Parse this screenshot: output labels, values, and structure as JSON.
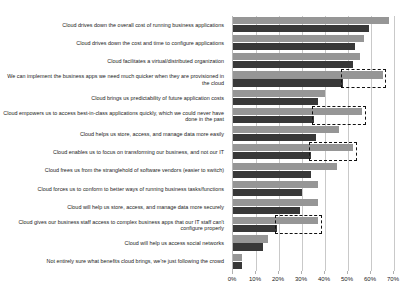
{
  "chart_data": {
    "type": "bar",
    "orientation": "horizontal",
    "title": "",
    "xlabel": "",
    "ylabel": "",
    "xlim": [
      0,
      70
    ],
    "xticks": [
      0,
      10,
      20,
      30,
      40,
      50,
      60,
      70
    ],
    "xtick_labels": [
      "0%",
      "10%",
      "20%",
      "30%",
      "40%",
      "50%",
      "60%",
      "70%"
    ],
    "grid": true,
    "legend": "none",
    "categories": [
      "Cloud drives down the overall cost of running business applications",
      "Cloud drives down the cost and time to configure applications",
      "Cloud facilitates a virtual/distributed organization",
      "We can implement the business apps we need much quicker when they are provisioned in the cloud",
      "Cloud brings us predictability of future application costs",
      "Cloud empowers us to access best-in-class applications quickly, which we could never have done in the past",
      "Cloud helps us store, access, and manage data more easily",
      "Cloud enables us to focus on transforming our business, and not our IT",
      "Cloud frees us from the stranglehold of software vendors (easier to switch)",
      "Cloud forces us to conform to better ways of running business tasks/functions",
      "Cloud will help us store, access, and manage data more securely",
      "Cloud gives our business staff access to complex business apps that our IT staff can't configure properly",
      "Cloud will help us access social networks",
      "Not entirely sure what benefits cloud brings, we're just following the crowd"
    ],
    "series": [
      {
        "name": "series-light",
        "color": "#969696",
        "values": [
          68,
          57,
          55,
          65,
          40,
          56,
          46,
          52,
          45,
          37,
          37,
          37,
          15,
          4
        ]
      },
      {
        "name": "series-dark",
        "color": "#383838",
        "values": [
          59,
          53,
          52,
          48,
          37,
          35,
          36,
          34,
          34,
          30,
          29,
          19,
          13,
          4
        ]
      }
    ],
    "highlighted_categories": [
      3,
      5,
      7,
      11
    ],
    "highlight_style": "dashed-black-box"
  }
}
